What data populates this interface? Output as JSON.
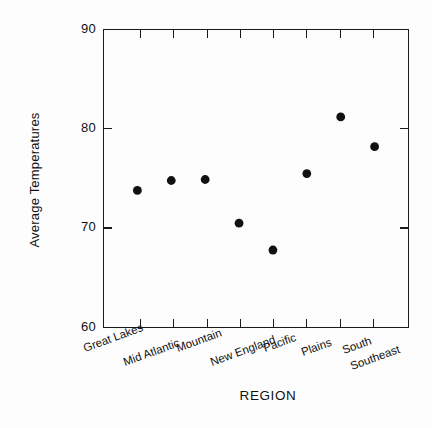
{
  "chart_data": {
    "type": "scatter",
    "title": "",
    "xlabel": "REGION",
    "ylabel": "Average Temperatures",
    "categories": [
      "Great Lakes",
      "Mid Atlantic",
      "Mountain",
      "New England",
      "Pacific",
      "Plains",
      "South",
      "Southeast"
    ],
    "values": [
      73.8,
      74.8,
      74.9,
      70.5,
      67.8,
      75.5,
      81.2,
      78.2
    ],
    "series": [
      {
        "name": "Average Temperatures",
        "values": [
          73.8,
          74.8,
          74.9,
          70.5,
          67.8,
          75.5,
          81.2,
          78.2
        ]
      }
    ],
    "ylim": [
      60,
      90
    ],
    "yticks": [
      60,
      70,
      80,
      90
    ],
    "ytick_labels": [
      "60",
      "70",
      "80",
      "90"
    ],
    "grid": false,
    "legend": "none",
    "marker": "filled-circle",
    "marker_color": "#111111",
    "frame": "box",
    "xtick_label_rotation_deg": -20,
    "xtick_label_stagger": true
  },
  "figure": {
    "background_color": "#fdfdfd",
    "axis_color": "#1a1a1a"
  }
}
